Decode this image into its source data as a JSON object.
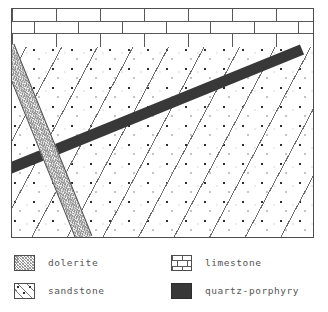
{
  "figure": {
    "frame": {
      "x": 11,
      "y": 8,
      "width": 303,
      "height": 230,
      "border_color": "#4d4d4d"
    },
    "units": [
      {
        "id": "limestone-band",
        "name": "limestone",
        "role": "upper stratified cap layer",
        "pattern": "brick",
        "band_top": 0,
        "band_height": 38,
        "brick_rows": 3,
        "brick_width": 44,
        "line_color": "#595959",
        "fill_color": "#ffffff"
      },
      {
        "id": "dolerite-body",
        "name": "dolerite",
        "role": "main host rock body",
        "pattern": "stipple-with-diagonal-hatch",
        "hatch_angle_deg": 118,
        "hatch_spacing": 31,
        "stipple_spacing": 19,
        "dot_color": "#2e2e2e",
        "line_color": "#6e6e6e",
        "fill_color": "#ffffff"
      },
      {
        "id": "sandstone-dike",
        "name": "sandstone",
        "role": "steep cross-cutting dike",
        "pattern": "fine-scribble",
        "top_x": 150,
        "bottom_x": 72,
        "thickness": 17,
        "fill_color": "#f7f7f7",
        "line_color": "#4d4d4d"
      },
      {
        "id": "porphyry-dike",
        "name": "quartz-porphyry",
        "role": "dark cross-cutting dike",
        "pattern": "solid",
        "start_x": 290,
        "start_y": 40,
        "end_x": 0,
        "end_y": 158,
        "thickness": 11,
        "fill_color": "#383838"
      }
    ]
  },
  "legend": {
    "columns": [
      {
        "id": "legend-column-left",
        "entries": [
          {
            "key": "dolerite",
            "label": "dolerite",
            "swatch": "dolerite-swatch",
            "color": "#fafafa"
          },
          {
            "key": "sandstone",
            "label": "sandstone",
            "swatch": "sandstone-swatch",
            "color": "#ffffff"
          }
        ]
      },
      {
        "id": "legend-column-right",
        "entries": [
          {
            "key": "limestone",
            "label": "limestone",
            "swatch": "limestone-swatch",
            "color": "#ffffff"
          },
          {
            "key": "quartz-porphyry",
            "label": "quartz-porphyry",
            "swatch": "porphyry-swatch",
            "color": "#383838"
          }
        ]
      }
    ]
  }
}
